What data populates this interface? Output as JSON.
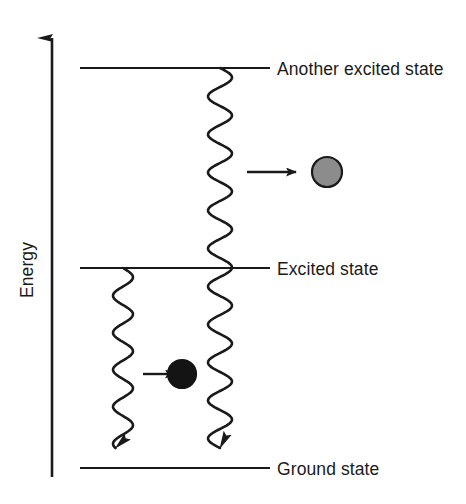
{
  "diagram": {
    "axis": {
      "label": "Energy",
      "direction": "up",
      "x": 52,
      "y_top": 26,
      "y_bottom": 477,
      "color": "#1a1a1a"
    },
    "levels": [
      {
        "id": "another-excited-state",
        "label": "Another excited state",
        "y": 68,
        "x_start": 80,
        "x_end": 270,
        "label_x": 277,
        "color": "#1a1a1a"
      },
      {
        "id": "excited-state",
        "label": "Excited state",
        "y": 268,
        "x_start": 80,
        "x_end": 270,
        "label_x": 277,
        "color": "#1a1a1a"
      },
      {
        "id": "ground-state",
        "label": "Ground state",
        "y": 468,
        "x_start": 80,
        "x_end": 270,
        "label_x": 277,
        "color": "#1a1a1a"
      }
    ],
    "transitions": [
      {
        "id": "long-wavy-transition",
        "description": "wavy emission arrow from another excited state to ground state",
        "center_x": 220,
        "y_start": 68,
        "y_end": 468,
        "amplitude": 12,
        "wavelength": 38,
        "arrowhead": "down",
        "color": "#1a1a1a"
      },
      {
        "id": "short-wavy-transition",
        "description": "wavy emission arrow from excited state to ground state",
        "center_x": 123,
        "y_start": 268,
        "y_end": 468,
        "amplitude": 10,
        "wavelength": 37,
        "arrowhead": "down",
        "color": "#1a1a1a"
      }
    ],
    "particles": [
      {
        "id": "grey-particle",
        "cx": 327,
        "cy": 172,
        "r": 15,
        "fill": "#8c8c8c",
        "stroke": "#1a1a1a"
      },
      {
        "id": "black-particle",
        "cx": 182,
        "cy": 374,
        "r": 14,
        "fill": "#141414",
        "stroke": "#141414"
      }
    ],
    "pointer_arrows": [
      {
        "id": "pointer-to-grey-particle",
        "x_start": 247,
        "x_end": 296,
        "y": 172,
        "color": "#1a1a1a"
      },
      {
        "id": "pointer-to-black-particle",
        "x_start": 143,
        "x_end": 175,
        "y": 374,
        "color": "#1a1a1a"
      }
    ]
  }
}
